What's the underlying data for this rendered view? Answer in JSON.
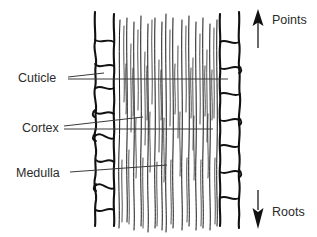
{
  "diagram": {
    "background_color": "#ffffff",
    "ink_color": "#111111",
    "text_color": "#2b2b2b",
    "leader_color": "#3a3a3a"
  },
  "labels": [
    {
      "id": "cuticle",
      "text": "Cuticle",
      "x": 18,
      "y": 80,
      "leaders": 2
    },
    {
      "id": "cortex",
      "text": "Cortex",
      "x": 22,
      "y": 130,
      "leaders": 2
    },
    {
      "id": "medulla",
      "text": "Medulla",
      "x": 16,
      "y": 177,
      "leaders": 1
    }
  ],
  "direction_markers": [
    {
      "id": "points",
      "text": "Points",
      "direction": "up",
      "icon": "arrow-up-icon",
      "arrow_x": 258,
      "arrow_top": 10,
      "arrow_bottom": 48,
      "text_x": 272,
      "text_y": 20
    },
    {
      "id": "roots",
      "text": "Roots",
      "direction": "down",
      "icon": "arrow-down-icon",
      "arrow_x": 258,
      "arrow_top": 190,
      "arrow_bottom": 228,
      "text_x": 272,
      "text_y": 216
    }
  ],
  "structure": {
    "shaft_left_x": 92,
    "shaft_right_x": 240,
    "shaft_top_y": 12,
    "shaft_bottom_y": 225,
    "cuticle_left_band": [
      92,
      115
    ],
    "cuticle_right_band": [
      218,
      240
    ],
    "cortex_band": [
      115,
      218
    ],
    "medulla_center_x": 166,
    "left_scale_count": 7,
    "right_scale_count": 7
  }
}
